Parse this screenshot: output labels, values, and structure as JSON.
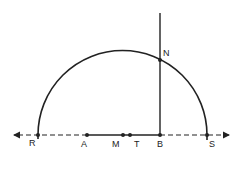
{
  "diagram": {
    "type": "geometry-construction",
    "colors": {
      "stroke": "#222222",
      "background": "#ffffff"
    },
    "baseline": {
      "y": 135,
      "x_start": 12,
      "x_end": 230,
      "style": "dashed",
      "arrows": "both"
    },
    "points": [
      {
        "id": "R",
        "label": "R",
        "x": 38,
        "y": 135,
        "label_dx": -7,
        "label_dy": 9
      },
      {
        "id": "A",
        "label": "A",
        "x": 87,
        "y": 135,
        "label_dx": -6,
        "label_dy": 10
      },
      {
        "id": "M",
        "label": "M",
        "x": 123,
        "y": 135,
        "label_dx": -11,
        "label_dy": 10
      },
      {
        "id": "T",
        "label": "T",
        "x": 130,
        "y": 135,
        "label_dx": 4,
        "label_dy": 10
      },
      {
        "id": "B",
        "label": "B",
        "x": 160,
        "y": 135,
        "label_dx": -3,
        "label_dy": 10
      },
      {
        "id": "S",
        "label": "S",
        "x": 207,
        "y": 135,
        "label_dx": 2,
        "label_dy": 10
      },
      {
        "id": "N",
        "label": "N",
        "x": 160,
        "y": 60,
        "label_dx": 3,
        "label_dy": -5
      }
    ],
    "segments": [
      {
        "from": "A",
        "to": "B",
        "style": "solid"
      },
      {
        "from": "B",
        "to": "N",
        "style": "solid",
        "extends_to_y": 13
      }
    ],
    "arc": {
      "type": "semicircle",
      "center_x": 122.5,
      "center_y": 135,
      "radius": 84.5,
      "from": "R",
      "to": "S",
      "through": "N"
    }
  }
}
